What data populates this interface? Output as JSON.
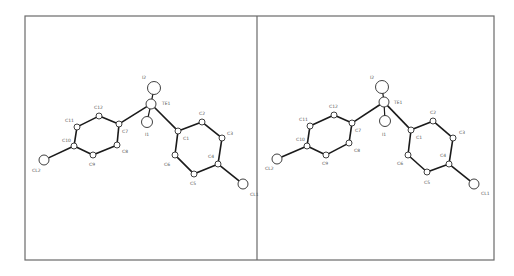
{
  "figure": {
    "type": "stereo-pair ORTEP molecular structure",
    "frame": {
      "x": 25,
      "y": 16,
      "width": 469,
      "height": 244,
      "divider_x": 257,
      "stroke": "#6a6a6a"
    },
    "colors": {
      "bond": "#1a1a1a",
      "atom_stroke": "#2a2a2a",
      "atom_fill": "#ffffff",
      "label": "#555555"
    }
  },
  "panels": [
    {
      "name": "left-view",
      "atoms": [
        {
          "id": "I2",
          "label": "I2",
          "x": 154,
          "y": 88,
          "r": 6.5,
          "lx": 142,
          "ly": 79
        },
        {
          "id": "TE1",
          "label": "TE1",
          "x": 151,
          "y": 104,
          "r": 5,
          "lx": 162,
          "ly": 105
        },
        {
          "id": "I1",
          "label": "I1",
          "x": 147,
          "y": 122,
          "r": 5.5,
          "lx": 145,
          "ly": 136
        },
        {
          "id": "C7",
          "label": "C7",
          "x": 119,
          "y": 124,
          "r": 3,
          "lx": 122,
          "ly": 133
        },
        {
          "id": "C12",
          "label": "C12",
          "x": 99,
          "y": 116,
          "r": 3,
          "lx": 94,
          "ly": 109
        },
        {
          "id": "C11",
          "label": "C11",
          "x": 77,
          "y": 127,
          "r": 3,
          "lx": 65,
          "ly": 122
        },
        {
          "id": "C10",
          "label": "C10",
          "x": 74,
          "y": 146,
          "r": 3,
          "lx": 62,
          "ly": 142
        },
        {
          "id": "C9",
          "label": "C9",
          "x": 93,
          "y": 155,
          "r": 3,
          "lx": 89,
          "ly": 166
        },
        {
          "id": "C8",
          "label": "C8",
          "x": 117,
          "y": 145,
          "r": 3,
          "lx": 122,
          "ly": 153
        },
        {
          "id": "CL2",
          "label": "CL2",
          "x": 44,
          "y": 160,
          "r": 5,
          "lx": 32,
          "ly": 172
        },
        {
          "id": "C1",
          "label": "C1",
          "x": 178,
          "y": 131,
          "r": 3,
          "lx": 183,
          "ly": 140
        },
        {
          "id": "C2",
          "label": "C2",
          "x": 202,
          "y": 122,
          "r": 3,
          "lx": 199,
          "ly": 115
        },
        {
          "id": "C3",
          "label": "C3",
          "x": 222,
          "y": 138,
          "r": 3,
          "lx": 227,
          "ly": 135
        },
        {
          "id": "C4",
          "label": "C4",
          "x": 218,
          "y": 164,
          "r": 3,
          "lx": 208,
          "ly": 158
        },
        {
          "id": "C5",
          "label": "C5",
          "x": 194,
          "y": 174,
          "r": 3,
          "lx": 190,
          "ly": 185
        },
        {
          "id": "C6",
          "label": "C6",
          "x": 175,
          "y": 155,
          "r": 3,
          "lx": 164,
          "ly": 166
        },
        {
          "id": "CL1",
          "label": "CL1",
          "x": 243,
          "y": 184,
          "r": 5,
          "lx": 250,
          "ly": 196
        }
      ]
    },
    {
      "name": "right-view",
      "atoms": [
        {
          "id": "I2",
          "label": "I2",
          "x": 382,
          "y": 87,
          "r": 6.5,
          "lx": 370,
          "ly": 79
        },
        {
          "id": "TE1",
          "label": "TE1",
          "x": 384,
          "y": 102,
          "r": 5,
          "lx": 394,
          "ly": 104
        },
        {
          "id": "I1",
          "label": "I1",
          "x": 385,
          "y": 121,
          "r": 5.5,
          "lx": 382,
          "ly": 136
        },
        {
          "id": "C7",
          "label": "C7",
          "x": 352,
          "y": 123,
          "r": 3,
          "lx": 355,
          "ly": 132
        },
        {
          "id": "C12",
          "label": "C12",
          "x": 334,
          "y": 115,
          "r": 3,
          "lx": 329,
          "ly": 108
        },
        {
          "id": "C11",
          "label": "C11",
          "x": 310,
          "y": 126,
          "r": 3,
          "lx": 299,
          "ly": 121
        },
        {
          "id": "C10",
          "label": "C10",
          "x": 307,
          "y": 146,
          "r": 3,
          "lx": 296,
          "ly": 141
        },
        {
          "id": "C9",
          "label": "C9",
          "x": 326,
          "y": 155,
          "r": 3,
          "lx": 322,
          "ly": 165
        },
        {
          "id": "C8",
          "label": "C8",
          "x": 349,
          "y": 143,
          "r": 3,
          "lx": 354,
          "ly": 152
        },
        {
          "id": "CL2",
          "label": "CL2",
          "x": 277,
          "y": 159,
          "r": 5,
          "lx": 265,
          "ly": 170
        },
        {
          "id": "C1",
          "label": "C1",
          "x": 411,
          "y": 130,
          "r": 3,
          "lx": 416,
          "ly": 139
        },
        {
          "id": "C2",
          "label": "C2",
          "x": 433,
          "y": 121,
          "r": 3,
          "lx": 430,
          "ly": 114
        },
        {
          "id": "C3",
          "label": "C3",
          "x": 453,
          "y": 138,
          "r": 3,
          "lx": 459,
          "ly": 134
        },
        {
          "id": "C4",
          "label": "C4",
          "x": 449,
          "y": 164,
          "r": 3,
          "lx": 440,
          "ly": 157
        },
        {
          "id": "C5",
          "label": "C5",
          "x": 427,
          "y": 172,
          "r": 3,
          "lx": 424,
          "ly": 184
        },
        {
          "id": "C6",
          "label": "C6",
          "x": 408,
          "y": 155,
          "r": 3,
          "lx": 397,
          "ly": 165
        },
        {
          "id": "CL1",
          "label": "CL1",
          "x": 474,
          "y": 184,
          "r": 5,
          "lx": 481,
          "ly": 195
        }
      ]
    }
  ],
  "bonds": [
    [
      "TE1",
      "I2"
    ],
    [
      "TE1",
      "I1"
    ],
    [
      "TE1",
      "C7"
    ],
    [
      "TE1",
      "C1"
    ],
    [
      "C7",
      "C12"
    ],
    [
      "C12",
      "C11"
    ],
    [
      "C11",
      "C10"
    ],
    [
      "C10",
      "C9"
    ],
    [
      "C9",
      "C8"
    ],
    [
      "C8",
      "C7"
    ],
    [
      "C10",
      "CL2"
    ],
    [
      "C1",
      "C2"
    ],
    [
      "C2",
      "C3"
    ],
    [
      "C3",
      "C4"
    ],
    [
      "C4",
      "C5"
    ],
    [
      "C5",
      "C6"
    ],
    [
      "C6",
      "C1"
    ],
    [
      "C4",
      "CL1"
    ]
  ]
}
